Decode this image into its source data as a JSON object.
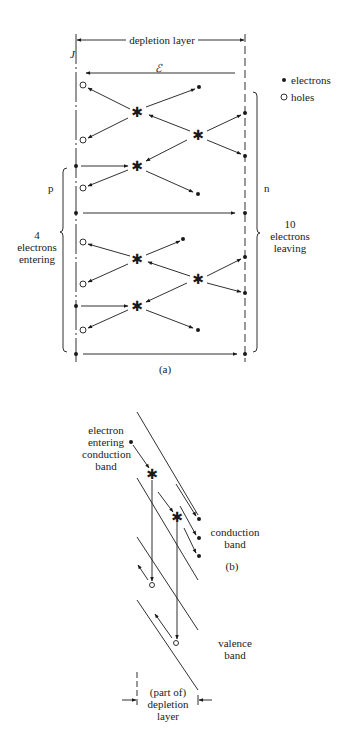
{
  "figure_a": {
    "caption": "(a)",
    "top_label": "depletion layer",
    "junction_label": "J",
    "field_label": "ℰ",
    "p_label": "p",
    "n_label": "n",
    "left_bracket": {
      "line1": "4",
      "line2": "electrons",
      "line3": "entering"
    },
    "right_bracket": {
      "line1": "10",
      "line2": "electrons",
      "line3": "leaving"
    },
    "legend": [
      {
        "symbol": "filled-dot",
        "label": "electrons"
      },
      {
        "symbol": "open-circle",
        "label": "holes"
      }
    ]
  },
  "figure_b": {
    "caption": "(b)",
    "entering_label": {
      "line1": "electron",
      "line2": "entering",
      "line3": "conduction",
      "line4": "band"
    },
    "conduction_label": {
      "line1": "conduction",
      "line2": "band"
    },
    "valence_label": {
      "line1": "valence",
      "line2": "band"
    },
    "depletion_label": {
      "line1": "(part of)",
      "line2": "depletion",
      "line3": "layer"
    }
  },
  "colors": {
    "ink": "#1a1a1a",
    "background": "#ffffff"
  }
}
